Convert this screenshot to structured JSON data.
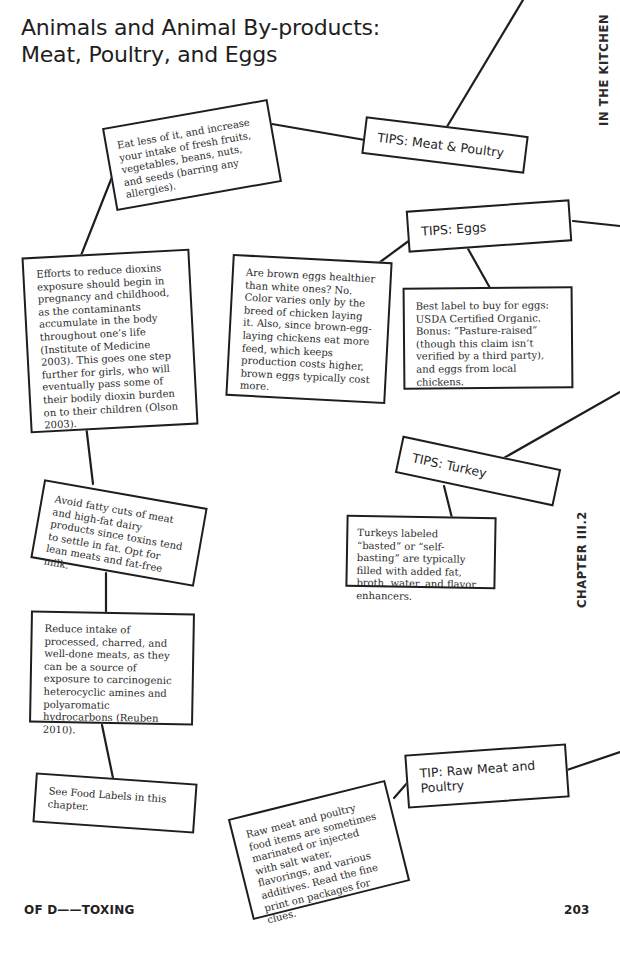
{
  "header": {
    "title_line1": "Animals and Animal By-products:",
    "title_line2": "Meat, Poultry, and Eggs"
  },
  "side_labels": {
    "top": "IN THE KITCHEN",
    "middle": "CHAPTER III.2"
  },
  "footer": {
    "left": "OF D——TOXING",
    "page_number": "203"
  },
  "tips": {
    "meat_poultry": "TIPS: Meat & Poultry",
    "eggs": "TIPS: Eggs",
    "turkey": "TIPS: Turkey",
    "raw_meat": "TIP: Raw Meat and Poultry"
  },
  "notes": {
    "eat_less": "Eat less of it, and increase your intake of fresh fruits, vegetables, beans, nuts, and seeds (barring any allergies).",
    "dioxins": "Efforts to reduce dioxins exposure should begin in pregnancy and childhood, as the contaminants accumulate in the body throughout one’s life (Institute of Medicine 2003). This goes one step further for girls, who will eventually pass some of their bodily dioxin burden on to their children (Olson 2003).",
    "brown_eggs": "Are brown eggs healthier than white ones? No. Color varies only by the breed of chicken laying it. Also, since brown-egg-laying chickens eat more feed, which keeps production costs higher, brown eggs typically cost more.",
    "egg_label": "Best label to buy for eggs: USDA Certified Organic. Bonus: “Pasture-raised” (though this claim isn’t verified by a third party), and eggs from local chickens.",
    "turkey_basted": "Turkeys labeled “basted” or “self-basting” are typically filled with added fat, broth, water, and flavor enhancers.",
    "fatty_cuts": "Avoid fatty cuts of meat and high-fat dairy products since toxins tend to settle in fat. Opt for lean meats and fat-free milk.",
    "processed": "Reduce intake of processed, charred, and well-done meats, as they can be a source of exposure to carcinogenic heterocyclic amines and polyaromatic hydrocarbons (Reuben 2010).",
    "food_labels": "See Food Labels in this chapter.",
    "raw_marinated": "Raw meat and poultry food items are sometimes marinated or injected with salt water, flavorings, and various additives. Read the fine print on packages for clues."
  }
}
